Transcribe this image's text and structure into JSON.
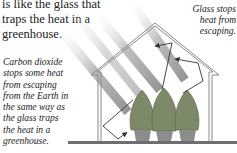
{
  "intro_text": "is like the glass that\ntraps the heat in a\ngreenhouse.",
  "caption_glass": "Glass stops\nheat from\nescaping.",
  "caption_co2": "Carbon dioxide\nstops some heat\nfrom escaping\nfrom the Earth in\nthe same way as\nthe glass traps\nthe heat in a\ngreenhouse.",
  "colors": {
    "frame": "#8a8a8a",
    "ground": "#6e6e6e",
    "sun_rays": "#9a9a9a",
    "plants": "#7d8a6a",
    "pots": "#8c8c8c",
    "heat_arrows": "#333333"
  },
  "elements": {
    "greenhouse": "greenhouse-outline",
    "plants_count": 3,
    "sun_rays_count": 4
  }
}
